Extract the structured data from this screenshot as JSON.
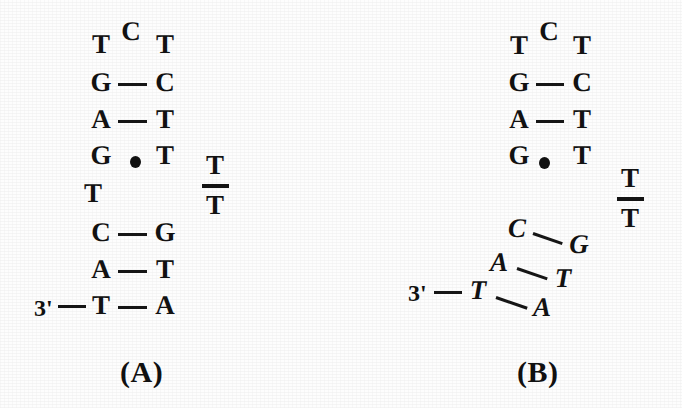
{
  "figure": {
    "background_color": "#fdfdfd",
    "ink_color": "#111111"
  },
  "panels": [
    {
      "id": "A",
      "caption": "(A)",
      "end_label": "3'",
      "loop_apex": "C",
      "loop_left": "T",
      "loop_right": "T",
      "bulge": "T",
      "dangling_fraction": {
        "numerator": "T",
        "denominator": "T"
      },
      "pairs": [
        {
          "left": "G",
          "right": "C",
          "bond": "dash",
          "tilted": false
        },
        {
          "left": "A",
          "right": "T",
          "bond": "dash",
          "tilted": false
        },
        {
          "left": "G",
          "right": "T",
          "bond": "dot",
          "tilted": false
        },
        {
          "left": "C",
          "right": "G",
          "bond": "dash",
          "tilted": false
        },
        {
          "left": "A",
          "right": "T",
          "bond": "dash",
          "tilted": false
        },
        {
          "left": "T",
          "right": "A",
          "bond": "dash",
          "tilted": false
        }
      ]
    },
    {
      "id": "B",
      "caption": "(B)",
      "end_label": "3'",
      "loop_apex": "C",
      "loop_left": "T",
      "loop_right": "T",
      "bulge": null,
      "dangling_fraction": {
        "numerator": "T",
        "denominator": "T"
      },
      "pairs": [
        {
          "left": "G",
          "right": "C",
          "bond": "dash",
          "tilted": false
        },
        {
          "left": "A",
          "right": "T",
          "bond": "dash",
          "tilted": false
        },
        {
          "left": "G",
          "right": "T",
          "bond": "dot",
          "tilted": false
        },
        {
          "left": "C",
          "right": "G",
          "bond": "dash",
          "tilted": true
        },
        {
          "left": "A",
          "right": "T",
          "bond": "dash",
          "tilted": true
        },
        {
          "left": "T",
          "right": "A",
          "bond": "dash",
          "tilted": true
        }
      ]
    }
  ]
}
